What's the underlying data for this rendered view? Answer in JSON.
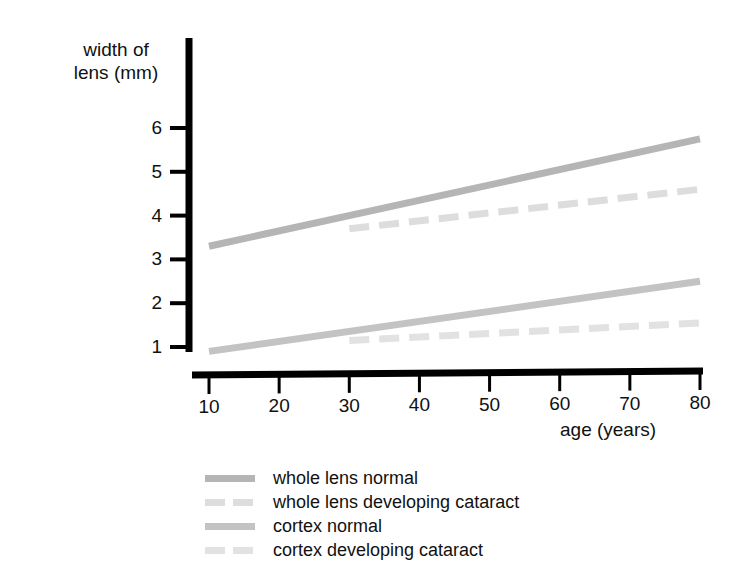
{
  "chart_data": {
    "type": "line",
    "title": "",
    "xlabel": "age (years)",
    "ylabel": "width of\nlens (mm)",
    "xlim": [
      10,
      80
    ],
    "ylim": [
      0.8,
      6.3
    ],
    "xticks": [
      10,
      20,
      30,
      40,
      50,
      60,
      70,
      80
    ],
    "yticks": [
      1,
      2,
      3,
      4,
      5,
      6
    ],
    "grid": false,
    "legend_position": "below",
    "series": [
      {
        "name": "whole lens normal",
        "style": "solid",
        "color": "#b5b5b5",
        "x": [
          10,
          80
        ],
        "values": [
          3.3,
          5.75
        ]
      },
      {
        "name": "whole lens developing cataract",
        "style": "dashed",
        "color": "#dddddd",
        "x": [
          30,
          80
        ],
        "values": [
          3.7,
          4.6
        ]
      },
      {
        "name": "cortex normal",
        "style": "solid",
        "color": "#c3c3c3",
        "x": [
          10,
          80
        ],
        "values": [
          0.9,
          2.5
        ]
      },
      {
        "name": "cortex developing cataract",
        "style": "dashed",
        "color": "#e2e2e2",
        "x": [
          30,
          80
        ],
        "values": [
          1.15,
          1.55
        ]
      }
    ]
  },
  "axes": {
    "y_title": "width of\nlens (mm)",
    "x_title": "age (years)",
    "y_tick_labels": [
      "6",
      "5",
      "4",
      "3",
      "2",
      "1"
    ],
    "x_tick_labels": [
      "10",
      "20",
      "30",
      "40",
      "50",
      "60",
      "70",
      "80"
    ],
    "axis_color": "#000000"
  },
  "legend": {
    "items": [
      {
        "label": "whole lens normal",
        "swatch": "solid-mid-gray",
        "color": "#b5b5b5"
      },
      {
        "label": "whole lens developing cataract",
        "swatch": "dashed-light-gray",
        "color": "#dddddd"
      },
      {
        "label": "cortex normal",
        "swatch": "solid-mid-gray",
        "color": "#c3c3c3"
      },
      {
        "label": "cortex developing cataract",
        "swatch": "dashed-light-gray",
        "color": "#e2e2e2"
      }
    ]
  }
}
